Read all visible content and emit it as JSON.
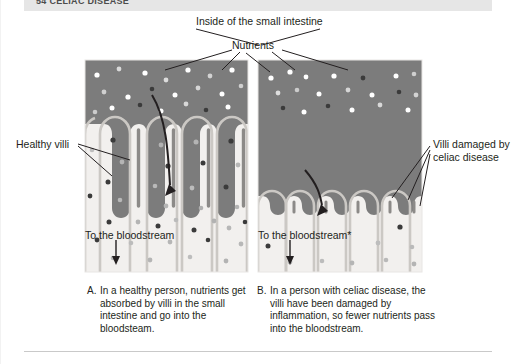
{
  "header": {
    "chapter_text": "54  CELIAC DISEASE"
  },
  "diagram": {
    "title": "Inside of the small intestine",
    "nutrients_label": "Nutrients",
    "healthy_villi_label": "Healthy villi",
    "damaged_villi_label": "Villi damaged by celiac disease",
    "bloodstream_label_a": "To the bloodstream",
    "bloodstream_label_b": "To the bloodstream*"
  },
  "captions": {
    "a": {
      "index": "A.",
      "text": "In a healthy person, nutrients get absorbed by villi in the small intestine and go into the bloodsteam."
    },
    "b": {
      "index": "B.",
      "text": "In a person with celiac disease, the villi have been damaged by inflammation, so fewer nutrients pass into the bloodstream."
    }
  },
  "colors": {
    "lumen": "#7c7c7c",
    "tissue": "#f2f0ee",
    "villi_outline": "#c9c6c2",
    "channel": "#8a8a8a",
    "header_bar": "#e6e6e6",
    "nutrient_white": "#ffffff",
    "nutrient_light": "#c8c8c8",
    "nutrient_dark": "#3b3b3b",
    "text": "#231f20"
  },
  "panels": {
    "a": {
      "label": "healthy-intestine-panel",
      "x": 85,
      "y": 60,
      "width": 163,
      "height": 212
    },
    "b": {
      "label": "celiac-intestine-panel",
      "x": 258,
      "y": 60,
      "width": 164,
      "height": 212
    }
  }
}
